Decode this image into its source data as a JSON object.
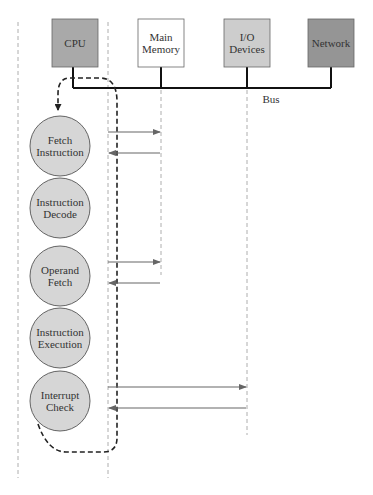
{
  "diagram": {
    "components": [
      {
        "id": "cpu",
        "label": [
          "CPU"
        ],
        "fill": "#a9a9a9"
      },
      {
        "id": "main-memory",
        "label": [
          "Main",
          "Memory"
        ],
        "fill": "#ffffff"
      },
      {
        "id": "io-devices",
        "label": [
          "I/O",
          "Devices"
        ],
        "fill": "#cdcdcd"
      },
      {
        "id": "network",
        "label": [
          "Network"
        ],
        "fill": "#959595"
      }
    ],
    "bus_label": "Bus",
    "stages": [
      {
        "id": "fetch-instruction",
        "label": [
          "Fetch",
          "Instruction"
        ],
        "target": "main-memory"
      },
      {
        "id": "instruction-decode",
        "label": [
          "Instruction",
          "Decode"
        ],
        "target": null
      },
      {
        "id": "operand-fetch",
        "label": [
          "Operand",
          "Fetch"
        ],
        "target": "main-memory"
      },
      {
        "id": "instruction-execution",
        "label": [
          "Instruction",
          "Execution"
        ],
        "target": null
      },
      {
        "id": "interrupt-check",
        "label": [
          "Interrupt",
          "Check"
        ],
        "target": "io-devices"
      }
    ],
    "colors": {
      "stage_fill": "#d6d6d6",
      "stroke": "#555555",
      "bus": "#111111",
      "arrow": "#666666",
      "guide": "#999999"
    }
  }
}
